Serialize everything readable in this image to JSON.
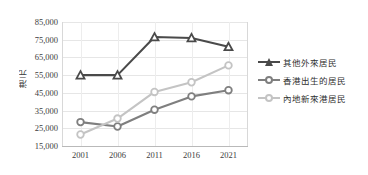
{
  "chart_data": {
    "type": "line",
    "title": "",
    "xlabel": "",
    "ylabel": "港元",
    "categories": [
      "2001",
      "2006",
      "2011",
      "2016",
      "2021"
    ],
    "ylim": [
      15000,
      85000
    ],
    "yticks": [
      "15,000",
      "25,000",
      "35,000",
      "45,000",
      "55,000",
      "65,000",
      "75,000",
      "85,000"
    ],
    "ytick_values": [
      15000,
      25000,
      35000,
      45000,
      55000,
      65000,
      75000,
      85000
    ],
    "grid": true,
    "legend_position": "right",
    "series": [
      {
        "name": "其他外來居民",
        "color": "#4a4a4a",
        "marker": "triangle",
        "values": [
          55000,
          55000,
          76500,
          76000,
          71000
        ]
      },
      {
        "name": "香港出生的居民",
        "color": "#7f7f7f",
        "marker": "circle",
        "values": [
          28500,
          26000,
          35500,
          43000,
          46500
        ]
      },
      {
        "name": "內地新來港居民",
        "color": "#c4c4c4",
        "marker": "circle",
        "values": [
          21500,
          30500,
          45500,
          51000,
          60500
        ]
      }
    ]
  }
}
